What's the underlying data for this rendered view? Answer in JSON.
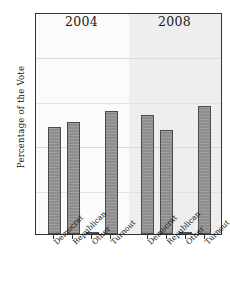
{
  "chart_data": {
    "type": "bar",
    "title": "",
    "xlabel": "",
    "ylabel": "Percentage of the Vote",
    "ylim": [
      0,
      100
    ],
    "yticks": [
      0,
      20,
      40,
      60,
      80,
      100
    ],
    "grid": true,
    "legend": "none",
    "categories": [
      "Democrat",
      "Republican",
      "Other",
      "Turnout"
    ],
    "panels": [
      {
        "label": "2004",
        "values": [
          48.0,
          50.5,
          1.0,
          55.5
        ]
      },
      {
        "label": "2008",
        "values": [
          53.5,
          47.0,
          1.0,
          57.5
        ]
      }
    ],
    "series": [
      {
        "name": "2004",
        "values": [
          48.0,
          50.5,
          1.0,
          55.5
        ]
      },
      {
        "name": "2008",
        "values": [
          53.5,
          47.0,
          1.0,
          57.5
        ]
      }
    ],
    "colors": {
      "bar_fill": "#8d8d8d",
      "bar_edge": "#4b4b4b",
      "panel_2004_bg": "#fbfbfb",
      "panel_2008_bg": "#eeeeee",
      "grid": "#e2e2e2",
      "frame": "#333333",
      "text": "#111111"
    }
  }
}
